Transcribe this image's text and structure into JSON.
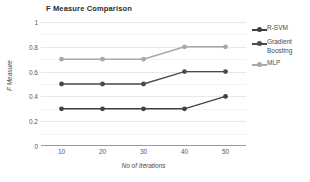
{
  "chart_data": {
    "type": "line",
    "title": "F Measure Comparison",
    "xlabel": "No of Iterations",
    "ylabel": "F Measure",
    "categories": [
      "10",
      "20",
      "30",
      "40",
      "50"
    ],
    "x": [
      10,
      20,
      30,
      40,
      50
    ],
    "xlim": [
      5,
      55
    ],
    "ylim": [
      0,
      1
    ],
    "yticks": [
      "0",
      "0.2",
      "0.4",
      "0.6",
      "0.8",
      "1"
    ],
    "ytick_values": [
      0,
      0.2,
      0.4,
      0.6,
      0.8,
      1
    ],
    "grid": true,
    "legend_position": "right",
    "markers": "circle",
    "series": [
      {
        "name": "R-SVM",
        "color": "#404040",
        "values": [
          0.3,
          0.3,
          0.3,
          0.3,
          0.4
        ]
      },
      {
        "name": "Gradient Boosting",
        "color": "#4a4a4a",
        "values": [
          0.5,
          0.5,
          0.5,
          0.6,
          0.6
        ]
      },
      {
        "name": "MLP",
        "color": "#a8a8a8",
        "values": [
          0.7,
          0.7,
          0.7,
          0.8,
          0.8
        ]
      }
    ]
  },
  "legend": {
    "entries": [
      {
        "label": "R-SVM"
      },
      {
        "label": "Gradient Boosting"
      },
      {
        "label": "MLP"
      }
    ]
  },
  "colors": {
    "background": "#ffffff",
    "grid": "#e9e9e9",
    "axis": "#9a9a9a",
    "title_text": "#2b2b2b",
    "tick_text": "#595959"
  }
}
